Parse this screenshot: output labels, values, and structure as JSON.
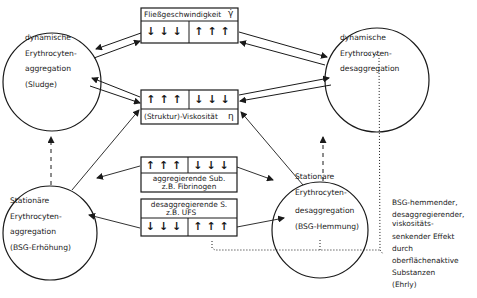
{
  "nodes": {
    "top_left": {
      "lines": [
        "dynamische",
        "Erythrocyten-",
        "aggregation",
        "(Sludge)"
      ]
    },
    "top_right": {
      "lines": [
        "dynamische",
        "Erythrocyten-",
        "desaggregation"
      ]
    },
    "bottom_left": {
      "lines": [
        "Stationäre",
        "Erythrocyten-",
        "aggregation",
        "(BSG-Erhöhung)"
      ]
    },
    "bottom_right": {
      "lines": [
        "Stationare",
        "Erythrocyten-",
        "desaggregation",
        "(BSG-Hemmung)"
      ]
    }
  },
  "boxes": {
    "flow_speed": {
      "label": "Fließgeschwindigkeit",
      "symbol": "γ̇",
      "left_arrows": "↓↓↓",
      "right_arrows": "↑↑↑"
    },
    "viscosity": {
      "label": "(Struktur)-Viskosität",
      "symbol": "η",
      "left_arrows": "↑↑↑",
      "right_arrows": "↓↓↓"
    },
    "aggregating": {
      "label_line1": "aggregierende Sub.",
      "label_line2": "z.B. Fibrinogen",
      "left_arrows": "↑↑↑",
      "right_arrows": "↓↓↓"
    },
    "desaggregating": {
      "label_line1": "desaggregierende S.",
      "label_line2": "z.B. UFS",
      "left_arrows": "↓↓↓",
      "right_arrows": "↑↑↑"
    }
  },
  "note": {
    "lines": [
      "BSG-hemmender,",
      "desaggregierender,",
      "viskositäts-",
      "senkender Effekt",
      "durch",
      "oberflächenaktive",
      "Substanzen",
      "(Ehrly)"
    ]
  },
  "colors": {
    "ink": "#1a1a1a",
    "background": "#ffffff"
  }
}
